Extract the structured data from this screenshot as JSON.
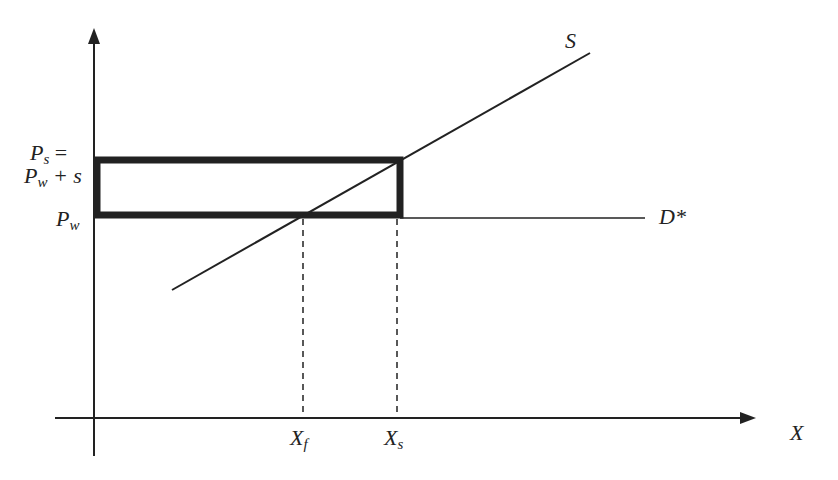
{
  "diagram": {
    "type": "supply-subsidy-diagram",
    "colors": {
      "line": "#222222",
      "background": "#ffffff"
    },
    "axes": {
      "x_label": "X",
      "y_label": ""
    },
    "curves": {
      "supply": {
        "label": "S"
      },
      "demand": {
        "label": "D*"
      }
    },
    "price_labels": {
      "ps_line1_main": "P",
      "ps_line1_sub": "s",
      "ps_line1_suffix": " =",
      "ps_line2_main": "P",
      "ps_line2_sub": "w",
      "ps_line2_suffix": " + s",
      "pw_main": "P",
      "pw_sub": "w"
    },
    "quantity_labels": {
      "xf_main": "X",
      "xf_sub": "f",
      "xs_main": "X",
      "xs_sub": "s"
    },
    "geometry": {
      "origin": [
        94,
        418
      ],
      "y_axis_top": 30,
      "x_axis_right": 755,
      "rect": {
        "x1": 97,
        "y1": 160,
        "x2": 400,
        "y2": 215
      },
      "world_price_y": 218,
      "supply_line": {
        "x1": 172,
        "y1": 290,
        "x2": 590,
        "y2": 53
      },
      "xf": 303,
      "xs": 397
    }
  }
}
